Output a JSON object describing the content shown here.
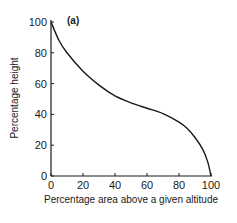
{
  "chart_data": {
    "type": "line",
    "title": "",
    "panel_label": "(a)",
    "xlabel": "Percentage area above a given altitude",
    "ylabel": "Percentage height",
    "xlim": [
      0,
      100
    ],
    "ylim": [
      0,
      100
    ],
    "grid": false,
    "legend": null,
    "x_ticks": [
      "0",
      "20",
      "40",
      "60",
      "80",
      "100"
    ],
    "y_ticks": [
      "0",
      "20",
      "40",
      "60",
      "80",
      "100"
    ],
    "series": [
      {
        "name": "hypsometric curve",
        "x": [
          0,
          5,
          10,
          20,
          30,
          40,
          50,
          60,
          70,
          80,
          85,
          90,
          95,
          98,
          100
        ],
        "y": [
          100,
          88,
          80,
          68,
          59,
          52,
          47.5,
          44,
          40.5,
          35,
          31,
          25,
          17,
          9,
          0
        ]
      }
    ],
    "colors": {
      "line": "#1a1a1a",
      "axis": "#1a1a1a"
    }
  }
}
